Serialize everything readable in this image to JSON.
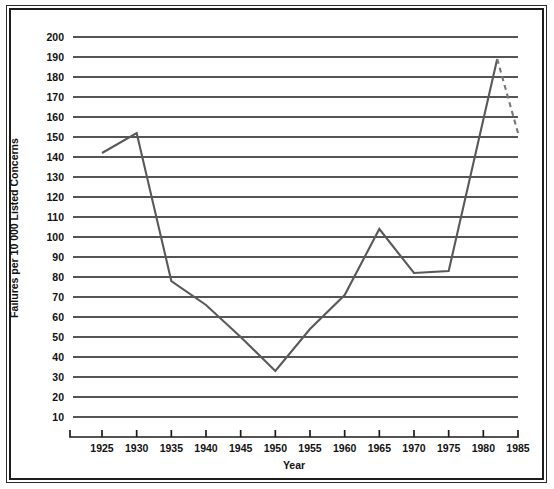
{
  "chart_data": {
    "type": "line",
    "title": "",
    "xlabel": "Year",
    "ylabel": "Failures per 10 000 Listed Concerns",
    "xlim": [
      1922,
      1987
    ],
    "ylim": [
      0,
      205
    ],
    "grid": "horizontal",
    "legend": "none",
    "x_ticks": [
      1925,
      1930,
      1935,
      1940,
      1945,
      1950,
      1955,
      1960,
      1965,
      1970,
      1975,
      1980,
      1985
    ],
    "y_ticks": [
      10,
      20,
      30,
      40,
      50,
      60,
      70,
      80,
      90,
      100,
      110,
      120,
      130,
      140,
      150,
      160,
      170,
      180,
      190,
      200
    ],
    "series": [
      {
        "name": "Failures per 10 000 Listed Concerns",
        "style": "solid",
        "color": "#595959",
        "x": [
          1925,
          1930,
          1935,
          1940,
          1945,
          1950,
          1955,
          1960,
          1965,
          1970,
          1975,
          1982
        ],
        "values": [
          142,
          152,
          78,
          66,
          50,
          33,
          54,
          71,
          104,
          82,
          83,
          189
        ]
      },
      {
        "name": "Failures per 10 000 Listed Concerns (provisional)",
        "style": "dashed",
        "color": "#777777",
        "x": [
          1982,
          1985
        ],
        "values": [
          189,
          152
        ]
      }
    ],
    "colors": {
      "line": "#595959",
      "dashed_line": "#777777",
      "gridline": "#1d1d1d",
      "axis": "#1d1d1d",
      "text": "#111111",
      "background": "#ffffff",
      "frame": "#2b2b2b"
    }
  },
  "axes": {
    "x_title": "Year",
    "y_title": "Failures per 10 000 Listed Concerns",
    "x_tick_labels": [
      "1925",
      "1930",
      "1935",
      "1940",
      "1945",
      "1950",
      "1955",
      "1960",
      "1965",
      "1970",
      "1975",
      "1980",
      "1985"
    ],
    "y_tick_labels": [
      "200",
      "190",
      "180",
      "170",
      "160",
      "150",
      "140",
      "130",
      "120",
      "110",
      "100",
      "90",
      "80",
      "70",
      "60",
      "50",
      "40",
      "30",
      "20",
      "10"
    ]
  }
}
